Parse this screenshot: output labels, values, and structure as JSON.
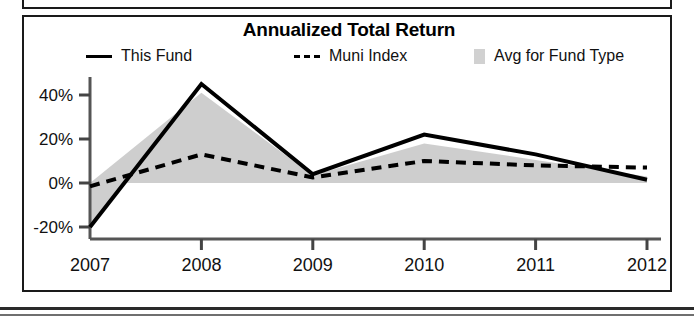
{
  "chart_data": {
    "type": "line",
    "title": "Annualized Total Return",
    "xlabel": "",
    "ylabel": "",
    "categories": [
      "2007",
      "2008",
      "2009",
      "2010",
      "2011",
      "2012"
    ],
    "x_axis_suffix_label": "YTD",
    "x_tick_labels": [
      "2007",
      "2008",
      "2009",
      "2010",
      "2011",
      "2012"
    ],
    "y_tick_labels": [
      "40%",
      "20%",
      "0%",
      "-20%"
    ],
    "y_tick_values": [
      40,
      20,
      0,
      -20
    ],
    "ylim": [
      -28,
      50
    ],
    "grid": false,
    "legend_position": "top",
    "series": [
      {
        "name": "This Fund",
        "style": "solid-line",
        "color": "#000000",
        "values": [
          -20,
          45,
          4,
          22,
          13,
          1.5
        ]
      },
      {
        "name": "Muni Index",
        "style": "dashed-line",
        "color": "#000000",
        "values": [
          -1.5,
          13,
          2.5,
          10,
          8,
          7
        ]
      },
      {
        "name": "Avg for Fund Type",
        "style": "shaded-area",
        "color": "#c9c9c9",
        "values": [
          0,
          41,
          3.5,
          18,
          10.5,
          3
        ]
      }
    ]
  },
  "chart": {
    "title": "Annualized Total Return",
    "legend": [
      {
        "label": "This Fund",
        "marker": "solid-line-swatch"
      },
      {
        "label": "Muni Index",
        "marker": "dashed-line-swatch"
      },
      {
        "label": "Avg for Fund Type",
        "marker": "area-swatch"
      }
    ],
    "y_axis": {
      "ticks": [
        {
          "label": "40%"
        },
        {
          "label": "20%"
        },
        {
          "label": "0%"
        },
        {
          "label": "-20%"
        }
      ]
    },
    "x_axis": {
      "ticks": [
        {
          "label": "2007"
        },
        {
          "label": "2008"
        },
        {
          "label": "2009"
        },
        {
          "label": "2010"
        },
        {
          "label": "2011"
        },
        {
          "label": "2012"
        }
      ],
      "suffix": "YTD"
    }
  }
}
